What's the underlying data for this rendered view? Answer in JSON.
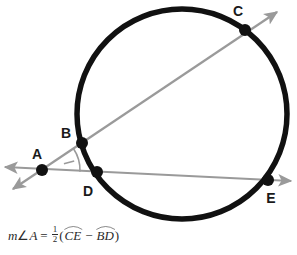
{
  "figure": {
    "background_color": "#ffffff",
    "circle": {
      "name": "circle",
      "cx": 182,
      "cy": 114,
      "r": 105,
      "stroke_color": "#111111",
      "stroke_width": 5.5
    },
    "line_color": "#9a9a9a",
    "point_color": "#111111",
    "label_color": "#1a1a1a",
    "points": [
      {
        "id": "A",
        "label": "A",
        "x": 42,
        "y": 170,
        "label_x": 37,
        "label_y": 159,
        "on_circle": false
      },
      {
        "id": "B",
        "label": "B",
        "x": 82,
        "y": 143,
        "label_x": 66,
        "label_y": 138,
        "on_circle": true
      },
      {
        "id": "C",
        "label": "C",
        "x": 245,
        "y": 30,
        "label_x": 238,
        "label_y": 16,
        "on_circle": true
      },
      {
        "id": "D",
        "label": "D",
        "x": 97,
        "y": 172,
        "label_x": 88,
        "label_y": 196,
        "on_circle": true
      },
      {
        "id": "E",
        "label": "E",
        "x": 268,
        "y": 180,
        "label_x": 271,
        "label_y": 203,
        "on_circle": true
      }
    ],
    "secants": [
      {
        "id": "secant-ABC",
        "name": "secant-line-a-b-c",
        "from_label": "A",
        "through": [
          "B",
          "C"
        ],
        "tail_x": 13,
        "tail_y": 189,
        "head_x": 277,
        "head_y": 12
      },
      {
        "id": "secant-ADE",
        "name": "secant-line-a-d-e",
        "from_label": "A",
        "through": [
          "D",
          "E"
        ],
        "tail_x": 5,
        "tail_y": 167,
        "head_x": 291,
        "head_y": 181
      }
    ],
    "angle_mark": {
      "name": "angle-arc-at-a",
      "vertex": "A",
      "radius": 38,
      "tick": true
    }
  },
  "formula": {
    "name": "secant-angle-formula",
    "measure_prefix": "m",
    "angle_symbol": "∠",
    "angle_vertex": "A",
    "equals": "=",
    "fraction_numerator": "1",
    "fraction_denominator": "2",
    "open_paren": "(",
    "arc1": "CE",
    "minus": "−",
    "arc2": "BD",
    "close_paren": ")",
    "plain_text": "m∠A = 1/2(arc CE − arc BD)"
  }
}
